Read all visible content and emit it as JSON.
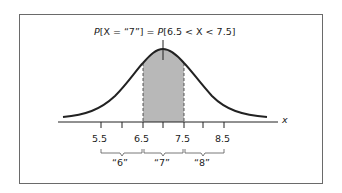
{
  "title": {
    "lhs_p": "P",
    "lhs_body": "[X = “7”] = ",
    "rhs_p": "P",
    "rhs_body": "[6.5 < X < 7.5]",
    "full": "P[X = “7”] = P[6.5 < X < 7.5]"
  },
  "axis": {
    "label": "x",
    "tick_labels": [
      "5.5",
      "6.5",
      "7.5",
      "8.5"
    ],
    "tick_values": [
      5.5,
      6.0,
      6.5,
      7.0,
      7.5,
      8.0,
      8.5
    ]
  },
  "brackets": [
    {
      "label": "“6”",
      "from": 5.5,
      "to": 6.5
    },
    {
      "label": "“7”",
      "from": 6.5,
      "to": 7.5
    },
    {
      "label": "“8”",
      "from": 7.5,
      "to": 8.5
    }
  ],
  "shaded_region": {
    "from": 6.5,
    "to": 7.5,
    "color": "#b8b8b8"
  },
  "colors": {
    "curve": "#222222",
    "frame": "#6a6a6a",
    "shade": "#b8b8b8"
  }
}
